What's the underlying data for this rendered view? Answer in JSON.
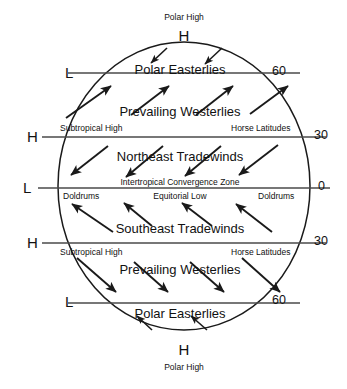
{
  "diagram": {
    "type": "earth-wind-circulation",
    "colors": {
      "stroke": "#1a1a1a",
      "background": "#ffffff",
      "text": "#111111"
    },
    "globe": {
      "center_x": 184,
      "center_y": 186,
      "radius_x": 126,
      "radius_y": 144
    },
    "top_caption": {
      "name": "Polar High",
      "letter": "H"
    },
    "bottom_caption": {
      "name": "Polar High",
      "letter": "H"
    },
    "latitude_lines": [
      {
        "id": "60n",
        "right_label": "60",
        "left_letter": "L",
        "y": 73
      },
      {
        "id": "30n",
        "right_label": "30",
        "left_letter": "H",
        "y": 137
      },
      {
        "id": "equator",
        "right_label": "0",
        "left_letter": "L",
        "y": 188
      },
      {
        "id": "30s",
        "right_label": "30",
        "left_letter": "H",
        "y": 243
      },
      {
        "id": "60s",
        "right_label": "60",
        "left_letter": "L",
        "y": 303
      }
    ],
    "bands": [
      {
        "id": "polar-easterlies-north",
        "label": "Polar Easterlies",
        "arrow_direction": "down-left",
        "arrow_count": 2
      },
      {
        "id": "prevailing-westerlies-north",
        "label": "Prevailing Westerlies",
        "arrow_direction": "up-right",
        "arrow_count": 4,
        "left_note": "Subtropical High",
        "right_note": "Horse Latitudes"
      },
      {
        "id": "northeast-tradewinds",
        "label": "Northeast Tradewinds",
        "arrow_direction": "down-left",
        "arrow_count": 4
      },
      {
        "id": "southeast-tradewinds",
        "label": "Southeast Tradewinds",
        "arrow_direction": "up-left",
        "arrow_count": 4
      },
      {
        "id": "prevailing-westerlies-south",
        "label": "Prevailing Westerlies",
        "arrow_direction": "down-right",
        "arrow_count": 4,
        "left_note": "Subtropical High",
        "right_note": "Horse Latitudes"
      },
      {
        "id": "polar-easterlies-south",
        "label": "Polar Easterlies",
        "arrow_direction": "up-left",
        "arrow_count": 2
      }
    ],
    "equator_zone": {
      "itcz_label": "Intertropical Convergence Zone",
      "doldrums_left": "Doldrums",
      "equatorial_low": "Equitorial Low",
      "doldrums_right": "Doldrums"
    }
  }
}
